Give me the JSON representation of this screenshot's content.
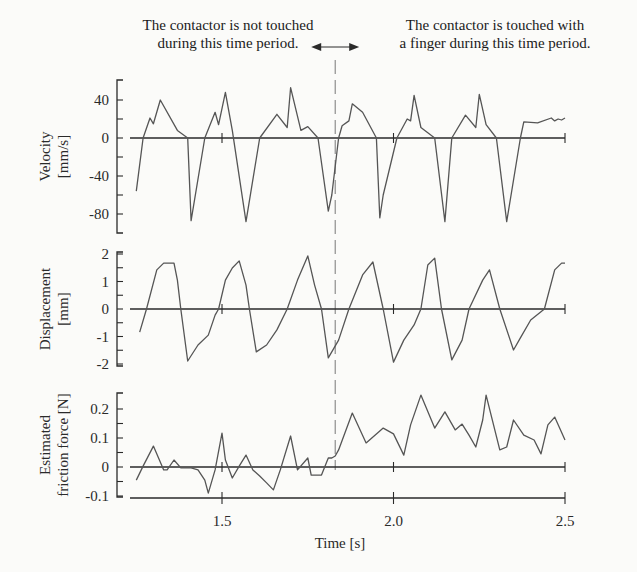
{
  "annotations": {
    "left_line1": "The contactor is not touched",
    "left_line2": "during this time period.",
    "right_line1": "The contactor is touched with",
    "right_line2": "a finger during this time period.",
    "divider_time": 1.83
  },
  "chart_data": [
    {
      "type": "line",
      "title": "",
      "xlabel": "Time [s]",
      "ylabel": "Velocity [mm/s]",
      "ylabel_lines": [
        "Velocity",
        "[mm/s]"
      ],
      "yticks": [
        40,
        0,
        -40,
        -80
      ],
      "ytick_labels": [
        "40",
        "0",
        "-40",
        "-80"
      ],
      "ylim": [
        -100,
        60
      ],
      "xlim": [
        1.23,
        2.5
      ],
      "series": [
        {
          "name": "Velocity",
          "x": [
            1.25,
            1.27,
            1.29,
            1.3,
            1.32,
            1.37,
            1.4,
            1.41,
            1.45,
            1.48,
            1.49,
            1.51,
            1.53,
            1.57,
            1.61,
            1.66,
            1.69,
            1.7,
            1.73,
            1.75,
            1.78,
            1.81,
            1.82,
            1.84,
            1.85,
            1.87,
            1.88,
            1.91,
            1.95,
            1.96,
            1.97,
            2.01,
            2.04,
            2.05,
            2.06,
            2.08,
            2.12,
            2.15,
            2.17,
            2.21,
            2.24,
            2.25,
            2.27,
            2.3,
            2.33,
            2.37,
            2.38,
            2.42,
            2.46,
            2.47,
            2.48,
            2.49,
            2.5
          ],
          "y": [
            -56,
            0,
            21,
            15,
            40,
            8,
            0,
            -87,
            0,
            27,
            14,
            48,
            8,
            -88,
            0,
            25,
            11,
            53,
            8,
            12,
            0,
            -77,
            -60,
            0,
            13,
            18,
            36,
            27,
            0,
            -84,
            -60,
            0,
            20,
            18,
            45,
            11,
            0,
            -88,
            0,
            24,
            11,
            46,
            14,
            0,
            -88,
            0,
            17,
            16,
            21,
            18,
            20,
            19,
            21
          ]
        }
      ]
    },
    {
      "type": "line",
      "title": "",
      "xlabel": "Time [s]",
      "ylabel": "Displacement [mm]",
      "ylabel_lines": [
        "Displacement",
        "[mm]"
      ],
      "yticks": [
        2,
        1,
        0,
        -1,
        -2
      ],
      "ytick_labels": [
        "2",
        "1",
        "0",
        "-1",
        "-2"
      ],
      "ylim": [
        -2,
        2
      ],
      "xlim": [
        1.23,
        2.5
      ],
      "series": [
        {
          "name": "Displacement",
          "x": [
            1.26,
            1.28,
            1.31,
            1.33,
            1.36,
            1.37,
            1.38,
            1.4,
            1.43,
            1.46,
            1.48,
            1.49,
            1.51,
            1.53,
            1.55,
            1.57,
            1.58,
            1.6,
            1.63,
            1.66,
            1.69,
            1.72,
            1.75,
            1.77,
            1.79,
            1.81,
            1.84,
            1.87,
            1.91,
            1.94,
            1.97,
            2.0,
            2.03,
            2.06,
            2.08,
            2.1,
            2.12,
            2.14,
            2.17,
            2.2,
            2.22,
            2.26,
            2.28,
            2.31,
            2.35,
            2.37,
            2.4,
            2.44,
            2.47,
            2.49,
            2.5
          ],
          "y": [
            -0.84,
            0,
            1.42,
            1.67,
            1.67,
            1.05,
            0,
            -1.89,
            -1.31,
            -0.95,
            -0.22,
            0,
            1.05,
            1.49,
            1.75,
            0.87,
            0,
            -1.56,
            -1.31,
            -0.76,
            0,
            1.05,
            1.93,
            0.87,
            0,
            -1.78,
            -1.13,
            0,
            1.24,
            1.71,
            0,
            -1.93,
            -1.13,
            -0.58,
            0,
            1.6,
            1.85,
            0,
            -1.85,
            -1.13,
            0,
            1.05,
            1.42,
            0,
            -1.49,
            -1.05,
            -0.4,
            0,
            1.42,
            1.67,
            1.67
          ]
        }
      ]
    },
    {
      "type": "line",
      "title": "",
      "xlabel": "Time [s]",
      "ylabel": "Estimated friction force [N]",
      "ylabel_lines": [
        "Estimated",
        "friction force [N]"
      ],
      "yticks": [
        0.2,
        0.1,
        0,
        -0.1
      ],
      "ytick_labels": [
        "0.2",
        "0.1",
        "0",
        "-0.1"
      ],
      "ylim": [
        -0.1,
        0.25
      ],
      "xlim": [
        1.23,
        2.5
      ],
      "xticks": [
        1.5,
        2.0,
        2.5
      ],
      "xtick_labels": [
        "1.5",
        "2.0",
        "2.5"
      ],
      "series": [
        {
          "name": "Estimated friction force",
          "x": [
            1.25,
            1.27,
            1.3,
            1.33,
            1.34,
            1.36,
            1.38,
            1.41,
            1.43,
            1.45,
            1.46,
            1.48,
            1.5,
            1.51,
            1.53,
            1.55,
            1.57,
            1.59,
            1.61,
            1.63,
            1.65,
            1.67,
            1.7,
            1.72,
            1.75,
            1.76,
            1.79,
            1.81,
            1.82,
            1.83,
            1.84,
            1.88,
            1.92,
            1.95,
            1.97,
            2.0,
            2.03,
            2.05,
            2.08,
            2.12,
            2.15,
            2.18,
            2.2,
            2.22,
            2.24,
            2.26,
            2.27,
            2.31,
            2.33,
            2.35,
            2.38,
            2.41,
            2.43,
            2.45,
            2.47,
            2.5
          ],
          "y": [
            -0.045,
            0.003,
            0.072,
            -0.01,
            -0.01,
            0.024,
            -0.003,
            -0.003,
            -0.01,
            -0.045,
            -0.09,
            -0.01,
            0.117,
            0.024,
            -0.038,
            0.003,
            0.041,
            -0.01,
            -0.031,
            -0.055,
            -0.079,
            -0.01,
            0.107,
            -0.01,
            0.031,
            -0.028,
            -0.028,
            0.031,
            0.031,
            0.038,
            0.059,
            0.186,
            0.083,
            0.114,
            0.134,
            0.114,
            0.041,
            0.145,
            0.248,
            0.134,
            0.19,
            0.128,
            0.148,
            0.11,
            0.069,
            0.162,
            0.248,
            0.059,
            0.069,
            0.162,
            0.11,
            0.093,
            0.045,
            0.145,
            0.172,
            0.093
          ]
        }
      ]
    }
  ]
}
